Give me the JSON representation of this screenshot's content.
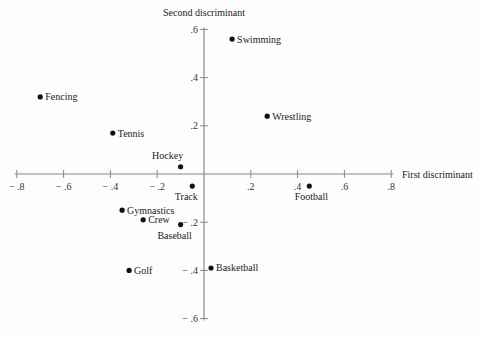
{
  "chart_data": {
    "type": "scatter",
    "title": "",
    "xlabel": "First discriminant",
    "ylabel": "Second discriminant",
    "xlim": [
      -0.8,
      0.8
    ],
    "ylim": [
      -0.6,
      0.6
    ],
    "grid": false,
    "legend": "none",
    "x_ticks": [
      "-.8",
      "-.6",
      "-.4",
      "-.2",
      ".2",
      ".4",
      ".6",
      ".8"
    ],
    "y_ticks": [
      ".6",
      ".4",
      ".2",
      "-.2",
      "-.4",
      "-.6"
    ],
    "points": [
      {
        "label": "Swimming",
        "x": 0.12,
        "y": 0.56,
        "label_pos": "right"
      },
      {
        "label": "Wrestling",
        "x": 0.27,
        "y": 0.24,
        "label_pos": "right"
      },
      {
        "label": "Fencing",
        "x": -0.7,
        "y": 0.32,
        "label_pos": "right"
      },
      {
        "label": "Tennis",
        "x": -0.39,
        "y": 0.17,
        "label_pos": "right"
      },
      {
        "label": "Hockey",
        "x": -0.1,
        "y": 0.03,
        "label_pos": "above"
      },
      {
        "label": "Track",
        "x": -0.05,
        "y": -0.05,
        "label_pos": "below"
      },
      {
        "label": "Football",
        "x": 0.45,
        "y": -0.05,
        "label_pos": "below"
      },
      {
        "label": "Gymnastics",
        "x": -0.35,
        "y": -0.15,
        "label_pos": "right"
      },
      {
        "label": "Crew",
        "x": -0.26,
        "y": -0.19,
        "label_pos": "right"
      },
      {
        "label": "Baseball",
        "x": -0.1,
        "y": -0.21,
        "label_pos": "below"
      },
      {
        "label": "Basketball",
        "x": 0.03,
        "y": -0.39,
        "label_pos": "right"
      },
      {
        "label": "Golf",
        "x": -0.32,
        "y": -0.4,
        "label_pos": "right"
      }
    ]
  },
  "colors": {
    "axis": "#888888",
    "point": "#111111",
    "text": "#222222"
  }
}
